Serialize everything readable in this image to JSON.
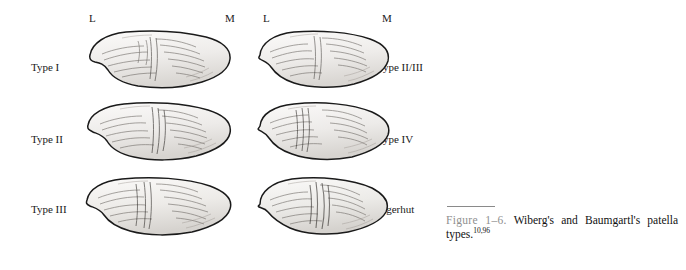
{
  "figure": {
    "number_label": "Figure 1–6.",
    "caption_main": "Wiberg's and Baumgartl's patella types.",
    "caption_superscript": "10,96",
    "columns": [
      {
        "left_marker": "L",
        "right_marker": "M"
      },
      {
        "left_marker": "L",
        "right_marker": "M"
      }
    ],
    "items": [
      {
        "label": "Type I",
        "column": 0,
        "row": 0
      },
      {
        "label": "Type II",
        "column": 0,
        "row": 1
      },
      {
        "label": "Type III",
        "column": 0,
        "row": 2
      },
      {
        "label": "Type II/III",
        "column": 1,
        "row": 0
      },
      {
        "label": "Type IV",
        "column": 1,
        "row": 1
      },
      {
        "label": "Jagerhut",
        "column": 1,
        "row": 2
      }
    ],
    "colors": {
      "outline": "#1a1a1a",
      "fill_light": "#f2f0ee",
      "fill_shade": "#d8d5d1",
      "hatch": "#6b6560",
      "caption_number": "#8f8f8f",
      "rule": "#8a8a8a",
      "background": "#ffffff"
    }
  }
}
